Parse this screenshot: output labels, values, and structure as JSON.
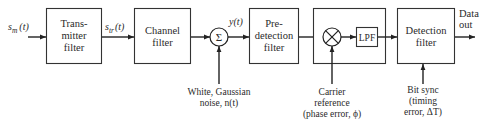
{
  "diagram": {
    "blocks": [
      {
        "id": "transmitter",
        "lines": [
          "Trans-",
          "mitter",
          "filter"
        ]
      },
      {
        "id": "channel",
        "lines": [
          "Channel",
          "filter"
        ]
      },
      {
        "id": "summer",
        "symbol": "Σ"
      },
      {
        "id": "predetection",
        "lines": [
          "Pre-",
          "detection",
          "filter"
        ]
      },
      {
        "id": "demodulator",
        "multiplier_symbol": "⊗",
        "lpf_label": "LPF"
      },
      {
        "id": "detection",
        "lines": [
          "Detection",
          "filter"
        ]
      }
    ],
    "signals": {
      "input": "s_m(t)",
      "input_base": "s",
      "input_sub": "m",
      "input_arg": "(t)",
      "transmitted_base": "s",
      "transmitted_sub": "tr",
      "transmitted_arg": "(t)",
      "received": "y(t)",
      "output_line1": "Data",
      "output_line2": "out"
    },
    "annotations": {
      "noise": [
        "White, Gaussian",
        "noise, n(t)"
      ],
      "carrier": [
        "Carrier",
        "reference",
        "(phase error, ϕ)"
      ],
      "bitsync": [
        "Bit sync",
        "(timing",
        "error, ΔT)"
      ]
    },
    "colors": {
      "line": "#222222",
      "text": "#2a2a2a",
      "background": "#ffffff"
    }
  }
}
